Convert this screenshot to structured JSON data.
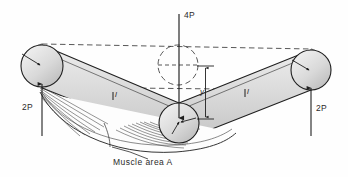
{
  "figure": {
    "background_color": "#fefefe",
    "line_color": "#1f1f1f",
    "fill_color": "#d8d8d8",
    "muscle_color": "#555555",
    "dashed_color": "#333333"
  },
  "labels": {
    "load_center": "4P",
    "reaction_left": "2P",
    "reaction_right": "2P",
    "segment_left": "l",
    "segment_right": "l",
    "deflection": "y",
    "caption": "Muscle area A"
  },
  "geometry": {
    "joint_left": {
      "cx": 42,
      "cy": 66,
      "r": 21
    },
    "joint_center": {
      "cx": 179,
      "cy": 123,
      "r": 20
    },
    "joint_right": {
      "cx": 311,
      "cy": 70,
      "r": 20
    },
    "ghost_center": {
      "cx": 178,
      "cy": 65,
      "r": 20
    },
    "reference_line_y": 65
  },
  "forces": [
    {
      "name": "center-load",
      "label": "4P",
      "direction": "down",
      "x": 179,
      "y_start": 14,
      "y_end": 120
    },
    {
      "name": "left-reaction",
      "label": "2P",
      "direction": "up",
      "x": 42,
      "y_start": 133,
      "y_end": 83
    },
    {
      "name": "right-reaction",
      "label": "2P",
      "direction": "up",
      "x": 311,
      "y_start": 133,
      "y_end": 86
    }
  ],
  "dimensions": [
    {
      "name": "deflection",
      "label": "y",
      "x": 205,
      "y_top": 66,
      "y_bottom": 119
    }
  ],
  "icon_names": [
    "arrow-down-icon",
    "arrow-up-icon",
    "dimension-arrow-icon",
    "leader-line-icon"
  ]
}
